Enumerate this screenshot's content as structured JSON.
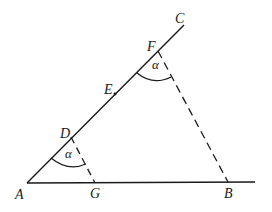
{
  "figure": {
    "type": "geometry",
    "stroke_color": "#1a1a1a",
    "background": "#ffffff"
  },
  "points": {
    "A": {
      "label": "A",
      "x": 27,
      "y": 183
    },
    "G": {
      "label": "G",
      "x": 95,
      "y": 183
    },
    "B": {
      "label": "B",
      "x": 228,
      "y": 183
    },
    "D": {
      "label": "D",
      "x": 71,
      "y": 137
    },
    "E": {
      "label": "E",
      "x": 115,
      "y": 94
    },
    "F": {
      "label": "F",
      "x": 158,
      "y": 51
    },
    "C": {
      "label": "C",
      "x": 184,
      "y": 25
    }
  },
  "angles": [
    {
      "vertex": "D",
      "label": "α"
    },
    {
      "vertex": "F",
      "label": "α"
    }
  ],
  "segments": {
    "solid": [
      "A-C",
      "A-B (extended)"
    ],
    "dashed": [
      "D-G",
      "F-B"
    ]
  }
}
